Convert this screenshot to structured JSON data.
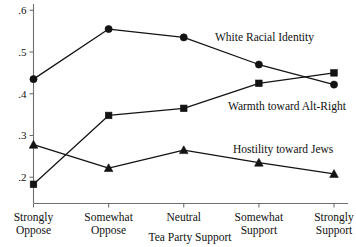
{
  "chart_data": {
    "type": "line",
    "title": "",
    "xlabel": "Tea Party Support",
    "ylabel": "",
    "categories": [
      "Strongly Oppose",
      "Somewhat Oppose",
      "Neutral",
      "Somewhat Support",
      "Strongly Support"
    ],
    "category_lines": [
      [
        "Strongly",
        "Oppose"
      ],
      [
        "Somewhat",
        "Oppose"
      ],
      [
        "Neutral",
        ""
      ],
      [
        "Somewhat",
        "Support"
      ],
      [
        "Strongly",
        "Support"
      ]
    ],
    "ylim": [
      0.155,
      0.615
    ],
    "yticks": [
      0.2,
      0.3,
      0.4,
      0.5,
      0.6
    ],
    "ytick_labels": [
      ".2",
      ".3",
      ".4",
      ".5",
      ".6"
    ],
    "grid": false,
    "legend_position": "inline-annotations",
    "series": [
      {
        "name": "White Racial Identity",
        "marker": "circle",
        "values": [
          0.435,
          0.555,
          0.535,
          0.47,
          0.422
        ],
        "label_x": 215,
        "label_y": 41
      },
      {
        "name": "Warmth toward Alt-Right",
        "marker": "square",
        "values": [
          0.183,
          0.348,
          0.365,
          0.425,
          0.45
        ],
        "label_x": 228,
        "label_y": 110
      },
      {
        "name": "Hostility toward Jews",
        "marker": "triangle",
        "values": [
          0.278,
          0.222,
          0.265,
          0.235,
          0.208
        ],
        "label_x": 233,
        "label_y": 153
      }
    ]
  },
  "axis": {
    "x_title": "Tea Party Support"
  }
}
